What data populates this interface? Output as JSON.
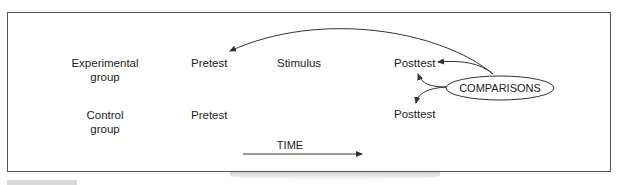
{
  "diagram": {
    "rows": [
      {
        "group_line1": "Experimental",
        "group_line2": "group",
        "pretest": "Pretest",
        "stimulus": "Stimulus",
        "posttest": "Posttest"
      },
      {
        "group_line1": "Control",
        "group_line2": "group",
        "pretest": "Pretest",
        "posttest": "Posttest"
      }
    ],
    "comparisons_label": "COMPARISONS",
    "time_label": "TIME",
    "colors": {
      "line": "#333333",
      "border": "#555555",
      "text": "#222222"
    }
  }
}
